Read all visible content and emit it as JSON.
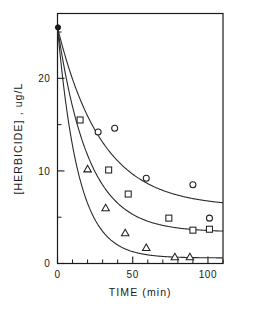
{
  "chart_data": {
    "type": "scatter",
    "title": "",
    "subtitle": "",
    "xlabel": "TIME  (min)",
    "ylabel": "[HERBICIDE] , ug/L",
    "xlim": [
      0,
      110
    ],
    "ylim": [
      0,
      27
    ],
    "xticks": [
      0,
      50,
      100
    ],
    "xticklabels": [
      "0",
      "50",
      "100"
    ],
    "xticks_minor": [
      10,
      20,
      30,
      40,
      60,
      70,
      80,
      90,
      110
    ],
    "yticks": [
      0,
      10,
      20
    ],
    "yticklabels": [
      "0",
      "10",
      "20"
    ],
    "yticks_minor": [
      5,
      15,
      25
    ],
    "grid": false,
    "legend": "none",
    "frame": "box",
    "start_point": {
      "x": 0,
      "y": 25.5,
      "label": "common-initial-concentration"
    },
    "series": [
      {
        "name": "circles",
        "marker": "circle",
        "points": [
          {
            "x": 0,
            "y": 25.5
          },
          {
            "x": 27,
            "y": 14.2
          },
          {
            "x": 38,
            "y": 14.6
          },
          {
            "x": 59,
            "y": 9.2
          },
          {
            "x": 90,
            "y": 8.5
          },
          {
            "x": 101,
            "y": 4.9
          }
        ],
        "fit_curve": {
          "y0": 25.5,
          "y_inf": 6.1,
          "k": 0.034
        }
      },
      {
        "name": "squares",
        "marker": "square",
        "points": [
          {
            "x": 0,
            "y": 25.5
          },
          {
            "x": 15,
            "y": 15.5
          },
          {
            "x": 34,
            "y": 10.1
          },
          {
            "x": 47,
            "y": 7.5
          },
          {
            "x": 74,
            "y": 4.9
          },
          {
            "x": 90,
            "y": 3.6
          },
          {
            "x": 101,
            "y": 3.7
          }
        ],
        "fit_curve": {
          "y0": 25.5,
          "y_inf": 3.4,
          "k": 0.049
        }
      },
      {
        "name": "triangles",
        "marker": "triangle",
        "points": [
          {
            "x": 0,
            "y": 25.5
          },
          {
            "x": 20,
            "y": 10.2
          },
          {
            "x": 32,
            "y": 6.0
          },
          {
            "x": 45,
            "y": 3.3
          },
          {
            "x": 59,
            "y": 1.7
          },
          {
            "x": 78,
            "y": 0.7
          },
          {
            "x": 88,
            "y": 0.7
          }
        ],
        "fit_curve": {
          "y0": 25.5,
          "y_inf": 0.6,
          "k": 0.072
        }
      }
    ]
  }
}
